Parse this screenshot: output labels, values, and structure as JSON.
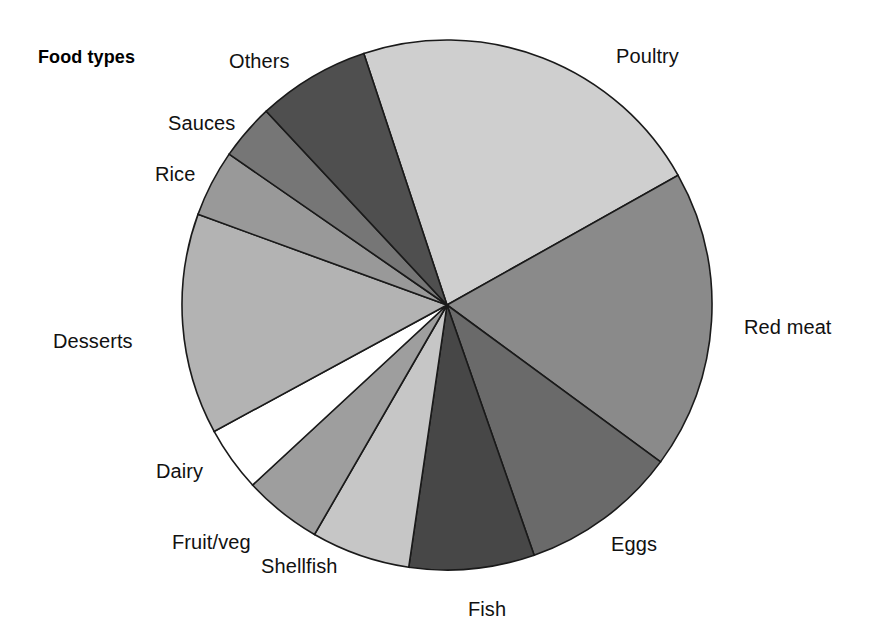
{
  "title": "Food types",
  "chart_data": {
    "type": "pie",
    "title": "Food types",
    "xlabel": "",
    "ylabel": "",
    "legend": "none (labels placed around the perimeter)",
    "grid": false,
    "total_degrees": 360,
    "labels": [
      "Poultry",
      "Red meat",
      "Eggs",
      "Fish",
      "Shellfish",
      "Fruit/veg",
      "Dairy",
      "Desserts",
      "Rice",
      "Sauces",
      "Others"
    ],
    "values": [
      21.9,
      18.2,
      9.6,
      7.6,
      6.0,
      4.8,
      4.0,
      13.5,
      4.1,
      3.4,
      6.9
    ],
    "value_unit": "percent",
    "slices": [
      {
        "label": "Poultry",
        "value": 21.9,
        "start_deg": -18.3,
        "end_deg": 60.7,
        "color": "#cfcfcf",
        "label_x": 616,
        "label_y": 45
      },
      {
        "label": "Red meat",
        "value": 18.2,
        "start_deg": 60.7,
        "end_deg": 126.3,
        "color": "#8a8a8a",
        "label_x": 744,
        "label_y": 316
      },
      {
        "label": "Eggs",
        "value": 9.6,
        "start_deg": 126.3,
        "end_deg": 160.8,
        "color": "#6a6a6a",
        "label_x": 611,
        "label_y": 533
      },
      {
        "label": "Fish",
        "value": 7.6,
        "start_deg": 160.8,
        "end_deg": 188.3,
        "color": "#474747",
        "label_x": 468,
        "label_y": 598
      },
      {
        "label": "Shellfish",
        "value": 6.0,
        "start_deg": 188.3,
        "end_deg": 210.0,
        "color": "#c6c6c6",
        "label_x": 261,
        "label_y": 555
      },
      {
        "label": "Fruit/veg",
        "value": 4.8,
        "start_deg": 210.0,
        "end_deg": 227.2,
        "color": "#9e9e9e",
        "label_x": 172,
        "label_y": 531
      },
      {
        "label": "Dairy",
        "value": 4.0,
        "start_deg": 227.2,
        "end_deg": 241.5,
        "color": "#ffffff",
        "label_x": 156,
        "label_y": 460
      },
      {
        "label": "Desserts",
        "value": 13.5,
        "start_deg": 241.5,
        "end_deg": 290.0,
        "color": "#b3b3b3",
        "label_x": 53,
        "label_y": 330
      },
      {
        "label": "Rice",
        "value": 4.1,
        "start_deg": 290.0,
        "end_deg": 304.7,
        "color": "#999999",
        "label_x": 155,
        "label_y": 163
      },
      {
        "label": "Sauces",
        "value": 3.4,
        "start_deg": 304.7,
        "end_deg": 317.0,
        "color": "#767676",
        "label_x": 168,
        "label_y": 112
      },
      {
        "label": "Others",
        "value": 6.9,
        "start_deg": 317.0,
        "end_deg": 341.7,
        "color": "#4f4f4f",
        "label_x": 229,
        "label_y": 50
      }
    ],
    "geometry": {
      "center_x": 447,
      "center_y": 305,
      "radius": 265
    },
    "colors": {
      "outline": "#1a1a1a",
      "background": "#ffffff",
      "text": "#111111"
    }
  }
}
